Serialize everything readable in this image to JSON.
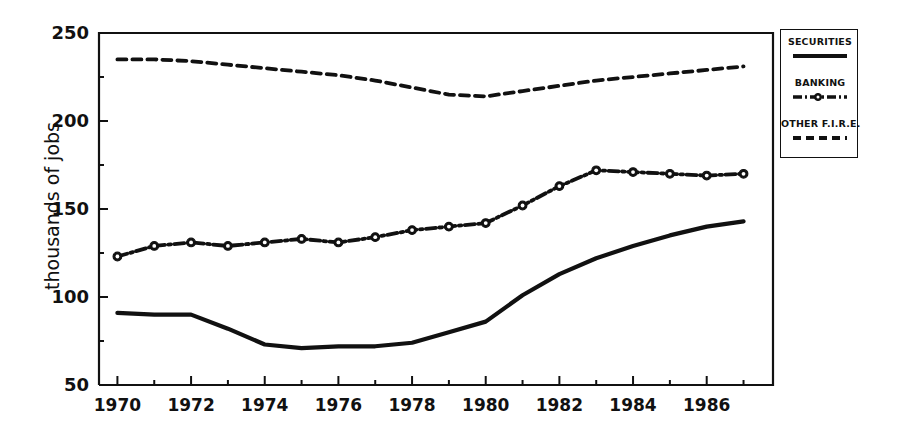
{
  "chart_data": {
    "type": "line",
    "title": "",
    "xlabel": "",
    "ylabel": "thousands of jobs",
    "xlim": [
      1969.5,
      1987.8
    ],
    "ylim": [
      50,
      250
    ],
    "yticks": [
      50,
      100,
      150,
      200,
      250
    ],
    "yticks_minor": [
      75,
      125,
      175,
      225
    ],
    "xticks": [
      1970,
      1972,
      1974,
      1976,
      1978,
      1980,
      1982,
      1984,
      1986
    ],
    "xticks_minor": [
      1971,
      1973,
      1975,
      1977,
      1979,
      1981,
      1983,
      1985,
      1987
    ],
    "xtick_labels": [
      "1970",
      "1972",
      "1974",
      "1976",
      "1978",
      "1980",
      "1982",
      "1984",
      "1986"
    ],
    "ytick_labels": [
      "50",
      "100",
      "150",
      "200",
      "250"
    ],
    "grid": false,
    "legend_position": "outside-right-top",
    "x": [
      1970,
      1971,
      1972,
      1973,
      1974,
      1975,
      1976,
      1977,
      1978,
      1979,
      1980,
      1981,
      1982,
      1983,
      1984,
      1985,
      1986,
      1987
    ],
    "series": [
      {
        "name": "SECURITIES",
        "style": "solid",
        "marker": "none",
        "color": "#111111",
        "values": [
          91,
          90,
          90,
          82,
          73,
          71,
          72,
          72,
          74,
          80,
          86,
          101,
          113,
          122,
          129,
          135,
          140,
          143
        ]
      },
      {
        "name": "BANKING",
        "style": "dash-dot",
        "marker": "circle",
        "color": "#111111",
        "values": [
          123,
          129,
          131,
          129,
          131,
          133,
          131,
          134,
          138,
          140,
          142,
          152,
          163,
          172,
          171,
          170,
          169,
          170
        ]
      },
      {
        "name": "OTHER F.I.R.E.",
        "style": "dashed",
        "marker": "none",
        "color": "#111111",
        "values": [
          235,
          235,
          234,
          232,
          230,
          228,
          226,
          223,
          219,
          215,
          214,
          217,
          220,
          223,
          225,
          227,
          229,
          231
        ]
      }
    ]
  },
  "axis": {
    "y_title": "thousands of jobs"
  },
  "legend": {
    "entries": [
      {
        "label": "SECURITIES",
        "style": "solid"
      },
      {
        "label": "BANKING",
        "style": "dash-dot-marker"
      },
      {
        "label": "OTHER F.I.R.E.",
        "style": "dashed"
      }
    ]
  }
}
